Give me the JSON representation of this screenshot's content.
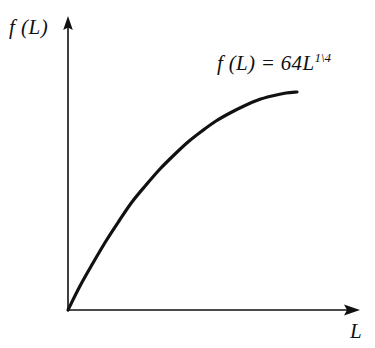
{
  "figure": {
    "background_color": "#ffffff",
    "ink_color": "#111111",
    "y_axis_label": "f (L)",
    "x_axis_label": "L",
    "equation": {
      "base": "f (L) = 64L",
      "exponent": "1\\4",
      "full": "f (L) = 64L^(1\\4)"
    }
  },
  "chart_data": {
    "type": "line",
    "title": "",
    "subtitle": "",
    "xlabel": "L",
    "ylabel": "f (L)",
    "annotations": [
      {
        "text": "f (L) = 64L^(1\\4)",
        "x_px": 217,
        "y_px": 51,
        "role": "curve-equation-label"
      }
    ],
    "legend": [],
    "legend_position": "none",
    "grid": false,
    "axis_ticks": [],
    "axis_tick_labels": [],
    "axis_style": {
      "y_axis_arrow": true,
      "x_axis_arrow": true,
      "origin_px": [
        68,
        310
      ],
      "y_axis_tip_px": [
        68,
        18
      ],
      "x_axis_tip_px": [
        358,
        310
      ],
      "axis_line_width_px": 1.6
    },
    "series": [
      {
        "name": "f (L) = 64L^(1\\4)",
        "color": "#111111",
        "line_width_px": 3.2,
        "function": "y = 64 * x^(1/4)",
        "shape": "increasing concave, steep near origin, flattening to the right",
        "x": [
          0,
          0.05,
          0.1,
          0.15,
          0.2,
          0.25,
          0.3,
          0.35,
          0.4,
          0.45,
          0.5,
          0.55,
          0.6,
          0.65,
          0.7,
          0.75,
          0.8,
          0.85,
          0.9,
          0.95,
          1
        ],
        "y": [
          0,
          0.31,
          0.43,
          0.52,
          0.6,
          0.66,
          0.71,
          0.76,
          0.8,
          0.83,
          0.86,
          0.89,
          0.92,
          0.94,
          0.96,
          0.98,
          0.99,
          1.0,
          1.0,
          1.0,
          1.0
        ],
        "points_px": [
          [
            68,
            310
          ],
          [
            80,
            286
          ],
          [
            93,
            263
          ],
          [
            106,
            241
          ],
          [
            119,
            221
          ],
          [
            132,
            202
          ],
          [
            146,
            185
          ],
          [
            160,
            169
          ],
          [
            174,
            155
          ],
          [
            188,
            142
          ],
          [
            202,
            131
          ],
          [
            216,
            121
          ],
          [
            230,
            113
          ],
          [
            244,
            106
          ],
          [
            258,
            100
          ],
          [
            272,
            96
          ],
          [
            286,
            93
          ],
          [
            297,
            92
          ]
        ]
      }
    ],
    "xlim_px": [
      68,
      358
    ],
    "ylim_px": [
      310,
      18
    ],
    "curve_start_px": [
      68,
      310
    ],
    "curve_end_px": [
      297,
      92
    ]
  }
}
